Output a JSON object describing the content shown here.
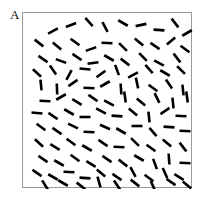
{
  "figure": {
    "domain": "scientific-figure",
    "canvas": {
      "width": 201,
      "height": 204,
      "background": "#ffffff"
    },
    "panel_label": {
      "text": "A",
      "x": 10,
      "y": 8,
      "font_size": 13,
      "color": "#0d0d0d"
    },
    "frame": {
      "name": "stimulus-field-border",
      "x": 22,
      "y": 12,
      "width": 170,
      "height": 176,
      "border_color": "#9a9a9a",
      "border_width": 1,
      "fill": "#ffffff"
    },
    "stimulus": {
      "description": "Field of randomly oriented short black line segments",
      "segment_count": 115,
      "segment_length": 11,
      "segment_thickness": 2.6,
      "segment_color": "#000000",
      "coordinate_space": {
        "width": 170,
        "height": 176
      },
      "segments": [
        {
          "x": 30,
          "y": 18,
          "angle": -28
        },
        {
          "x": 48,
          "y": 12,
          "angle": -22
        },
        {
          "x": 66,
          "y": 9,
          "angle": 48
        },
        {
          "x": 82,
          "y": 14,
          "angle": 62
        },
        {
          "x": 100,
          "y": 10,
          "angle": 30
        },
        {
          "x": 118,
          "y": 12,
          "angle": -12
        },
        {
          "x": 136,
          "y": 17,
          "angle": 4
        },
        {
          "x": 152,
          "y": 10,
          "angle": 52
        },
        {
          "x": 164,
          "y": 20,
          "angle": -30
        },
        {
          "x": 16,
          "y": 30,
          "angle": 38
        },
        {
          "x": 34,
          "y": 33,
          "angle": 40
        },
        {
          "x": 52,
          "y": 29,
          "angle": 36
        },
        {
          "x": 68,
          "y": 36,
          "angle": -20
        },
        {
          "x": 84,
          "y": 30,
          "angle": 2
        },
        {
          "x": 100,
          "y": 34,
          "angle": 44
        },
        {
          "x": 116,
          "y": 29,
          "angle": 40
        },
        {
          "x": 132,
          "y": 33,
          "angle": 34
        },
        {
          "x": 148,
          "y": 28,
          "angle": -40
        },
        {
          "x": 162,
          "y": 36,
          "angle": 36
        },
        {
          "x": 20,
          "y": 46,
          "angle": 34
        },
        {
          "x": 38,
          "y": 48,
          "angle": 20
        },
        {
          "x": 54,
          "y": 44,
          "angle": 34
        },
        {
          "x": 70,
          "y": 50,
          "angle": -8
        },
        {
          "x": 86,
          "y": 45,
          "angle": 30
        },
        {
          "x": 102,
          "y": 49,
          "angle": 38
        },
        {
          "x": 120,
          "y": 44,
          "angle": 46
        },
        {
          "x": 136,
          "y": 50,
          "angle": 28
        },
        {
          "x": 154,
          "y": 45,
          "angle": 52
        },
        {
          "x": 14,
          "y": 60,
          "angle": 42
        },
        {
          "x": 30,
          "y": 57,
          "angle": 56
        },
        {
          "x": 46,
          "y": 62,
          "angle": -62
        },
        {
          "x": 62,
          "y": 56,
          "angle": 6
        },
        {
          "x": 78,
          "y": 61,
          "angle": -36
        },
        {
          "x": 94,
          "y": 57,
          "angle": 70
        },
        {
          "x": 110,
          "y": 62,
          "angle": -28
        },
        {
          "x": 126,
          "y": 56,
          "angle": 48
        },
        {
          "x": 142,
          "y": 60,
          "angle": 30
        },
        {
          "x": 158,
          "y": 57,
          "angle": 44
        },
        {
          "x": 18,
          "y": 72,
          "angle": 84
        },
        {
          "x": 34,
          "y": 76,
          "angle": 88
        },
        {
          "x": 50,
          "y": 70,
          "angle": -34
        },
        {
          "x": 66,
          "y": 75,
          "angle": 2
        },
        {
          "x": 82,
          "y": 71,
          "angle": -30
        },
        {
          "x": 98,
          "y": 76,
          "angle": 86
        },
        {
          "x": 114,
          "y": 70,
          "angle": 78
        },
        {
          "x": 130,
          "y": 75,
          "angle": 36
        },
        {
          "x": 146,
          "y": 71,
          "angle": 56
        },
        {
          "x": 160,
          "y": 77,
          "angle": 84
        },
        {
          "x": 22,
          "y": 88,
          "angle": 2
        },
        {
          "x": 38,
          "y": 84,
          "angle": -30
        },
        {
          "x": 54,
          "y": 89,
          "angle": 32
        },
        {
          "x": 70,
          "y": 85,
          "angle": 34
        },
        {
          "x": 86,
          "y": 90,
          "angle": 28
        },
        {
          "x": 102,
          "y": 84,
          "angle": 82
        },
        {
          "x": 118,
          "y": 89,
          "angle": 40
        },
        {
          "x": 134,
          "y": 85,
          "angle": 64
        },
        {
          "x": 150,
          "y": 90,
          "angle": 84
        },
        {
          "x": 164,
          "y": 84,
          "angle": 82
        },
        {
          "x": 14,
          "y": 100,
          "angle": 6
        },
        {
          "x": 30,
          "y": 103,
          "angle": 34
        },
        {
          "x": 46,
          "y": 99,
          "angle": 30
        },
        {
          "x": 62,
          "y": 104,
          "angle": 0
        },
        {
          "x": 78,
          "y": 98,
          "angle": 28
        },
        {
          "x": 94,
          "y": 103,
          "angle": 4
        },
        {
          "x": 110,
          "y": 99,
          "angle": 40
        },
        {
          "x": 126,
          "y": 104,
          "angle": 84
        },
        {
          "x": 142,
          "y": 98,
          "angle": -34
        },
        {
          "x": 158,
          "y": 103,
          "angle": 2
        },
        {
          "x": 18,
          "y": 114,
          "angle": 36
        },
        {
          "x": 34,
          "y": 118,
          "angle": 34
        },
        {
          "x": 50,
          "y": 113,
          "angle": 26
        },
        {
          "x": 66,
          "y": 119,
          "angle": 2
        },
        {
          "x": 82,
          "y": 114,
          "angle": 24
        },
        {
          "x": 98,
          "y": 118,
          "angle": 30
        },
        {
          "x": 114,
          "y": 113,
          "angle": 0
        },
        {
          "x": 130,
          "y": 119,
          "angle": 50
        },
        {
          "x": 146,
          "y": 114,
          "angle": 4
        },
        {
          "x": 162,
          "y": 118,
          "angle": 2
        },
        {
          "x": 16,
          "y": 130,
          "angle": 42
        },
        {
          "x": 32,
          "y": 134,
          "angle": 32
        },
        {
          "x": 48,
          "y": 129,
          "angle": 36
        },
        {
          "x": 64,
          "y": 135,
          "angle": 30
        },
        {
          "x": 80,
          "y": 130,
          "angle": 34
        },
        {
          "x": 96,
          "y": 134,
          "angle": 2
        },
        {
          "x": 112,
          "y": 129,
          "angle": 44
        },
        {
          "x": 128,
          "y": 135,
          "angle": 36
        },
        {
          "x": 144,
          "y": 130,
          "angle": 40
        },
        {
          "x": 160,
          "y": 134,
          "angle": 52
        },
        {
          "x": 20,
          "y": 146,
          "angle": 34
        },
        {
          "x": 36,
          "y": 150,
          "angle": 30
        },
        {
          "x": 52,
          "y": 145,
          "angle": 36
        },
        {
          "x": 68,
          "y": 151,
          "angle": 32
        },
        {
          "x": 84,
          "y": 146,
          "angle": 34
        },
        {
          "x": 100,
          "y": 150,
          "angle": 38
        },
        {
          "x": 116,
          "y": 145,
          "angle": 30
        },
        {
          "x": 132,
          "y": 151,
          "angle": 70
        },
        {
          "x": 146,
          "y": 146,
          "angle": 86
        },
        {
          "x": 162,
          "y": 150,
          "angle": 2
        },
        {
          "x": 14,
          "y": 160,
          "angle": 34
        },
        {
          "x": 30,
          "y": 164,
          "angle": 30
        },
        {
          "x": 46,
          "y": 159,
          "angle": 2
        },
        {
          "x": 62,
          "y": 165,
          "angle": 4
        },
        {
          "x": 78,
          "y": 160,
          "angle": 40
        },
        {
          "x": 94,
          "y": 164,
          "angle": 34
        },
        {
          "x": 110,
          "y": 159,
          "angle": 62
        },
        {
          "x": 126,
          "y": 165,
          "angle": 36
        },
        {
          "x": 142,
          "y": 160,
          "angle": 66
        },
        {
          "x": 156,
          "y": 164,
          "angle": 32
        },
        {
          "x": 22,
          "y": 172,
          "angle": 58
        },
        {
          "x": 40,
          "y": 170,
          "angle": 30
        },
        {
          "x": 58,
          "y": 173,
          "angle": 38
        },
        {
          "x": 76,
          "y": 169,
          "angle": 74
        },
        {
          "x": 94,
          "y": 172,
          "angle": 56
        },
        {
          "x": 112,
          "y": 170,
          "angle": 38
        },
        {
          "x": 130,
          "y": 173,
          "angle": 66
        },
        {
          "x": 148,
          "y": 169,
          "angle": 34
        },
        {
          "x": 164,
          "y": 172,
          "angle": 40
        }
      ]
    }
  }
}
